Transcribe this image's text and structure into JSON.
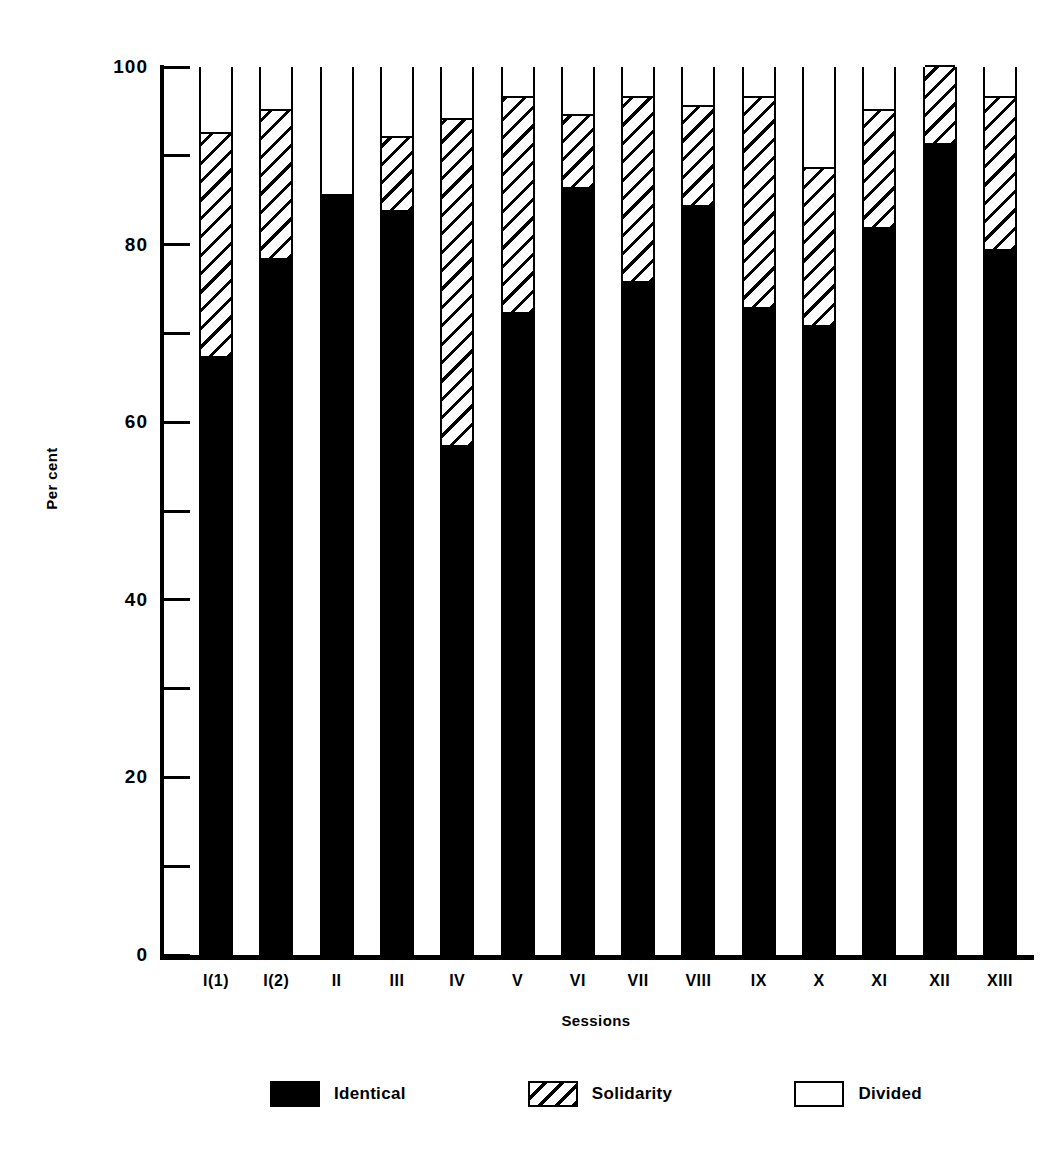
{
  "chart_data": {
    "type": "bar",
    "subtype": "stacked-100-percent",
    "title": "",
    "xlabel": "Sessions",
    "ylabel": "Per cent",
    "ylim": [
      0,
      100
    ],
    "grid": false,
    "legend_position": "bottom",
    "y_major_ticks": [
      0,
      20,
      40,
      60,
      80,
      100
    ],
    "y_major_tick_labels": [
      "0",
      "20",
      "40",
      "60",
      "80",
      "100"
    ],
    "y_minor_ticks": [
      10,
      30,
      50,
      70,
      90
    ],
    "categories": [
      "I(1)",
      "I(2)",
      "II",
      "III",
      "IV",
      "V",
      "VI",
      "VII",
      "VIII",
      "IX",
      "X",
      "XI",
      "XII",
      "XIII"
    ],
    "series": [
      {
        "name": "Identical",
        "color": "#000000",
        "pattern": "solid",
        "values": [
          67,
          78,
          85.5,
          83.5,
          57,
          72,
          86,
          75.5,
          84,
          72.5,
          70.5,
          81.5,
          91,
          79
        ]
      },
      {
        "name": "Solidarity",
        "color": "#000000",
        "pattern": "diagonal-hatch",
        "values": [
          25.5,
          17,
          0,
          8.5,
          37,
          24.5,
          8.5,
          21,
          11.5,
          24,
          18,
          13.5,
          9,
          17.5
        ]
      },
      {
        "name": "Divided",
        "color": "#ffffff",
        "pattern": "empty",
        "values": [
          7.5,
          5,
          14.5,
          8,
          6,
          3.5,
          5.5,
          3.5,
          4.5,
          3.5,
          11.5,
          5,
          0,
          3.5
        ]
      }
    ]
  },
  "legend": {
    "items": [
      {
        "label": "Identical",
        "swatch": "solid-black-swatch"
      },
      {
        "label": "Solidarity",
        "swatch": "hatched-swatch"
      },
      {
        "label": "Divided",
        "swatch": "empty-swatch"
      }
    ]
  }
}
